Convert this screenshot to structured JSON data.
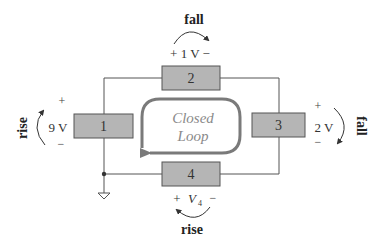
{
  "diagram": {
    "type": "circuit",
    "colors": {
      "wire": "#555555",
      "box_fill": "#b5b5b5",
      "box_stroke": "#555555",
      "loop_arrow": "#7a7a7a",
      "loop_text": "#8a8a8a",
      "text": "#333333"
    },
    "elements": [
      {
        "id": "1",
        "label": "1",
        "voltage": "9 V",
        "plus": "+",
        "minus": "−",
        "direction": "rise"
      },
      {
        "id": "2",
        "label": "2",
        "voltage": "+ 1 V −",
        "direction": "fall"
      },
      {
        "id": "3",
        "label": "3",
        "voltage": "2 V",
        "plus": "+",
        "minus": "−",
        "direction": "fall"
      },
      {
        "id": "4",
        "label": "4",
        "plus": "+",
        "voltage_symbol": "V",
        "voltage_subscript": "4",
        "minus": "−",
        "direction": "rise"
      }
    ],
    "loop": {
      "line1": "Closed",
      "line2": "Loop"
    },
    "ground": "ground-symbol",
    "junction": "node-dot"
  }
}
